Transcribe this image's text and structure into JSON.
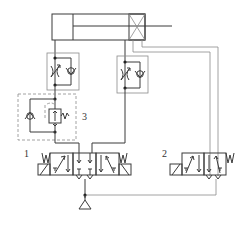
{
  "diagram": {
    "type": "hydraulic circuit",
    "labels": {
      "valve1": "1",
      "valve2": "2",
      "component3": "3"
    },
    "components": [
      {
        "id": "cylinder",
        "name": "double-acting cylinder with cushion"
      },
      {
        "id": "throttle-check-1",
        "name": "throttle check valve (rod-less side)"
      },
      {
        "id": "throttle-check-2",
        "name": "throttle check valve (rod side)"
      },
      {
        "id": "component-3",
        "name": "pressure reducing valve with check valve"
      },
      {
        "id": "valve-1",
        "name": "3-position directional valve, spring-centered, solenoid operated"
      },
      {
        "id": "valve-2",
        "name": "2-position directional valve, solenoid with spring return"
      },
      {
        "id": "tank",
        "name": "reservoir / return"
      }
    ]
  }
}
